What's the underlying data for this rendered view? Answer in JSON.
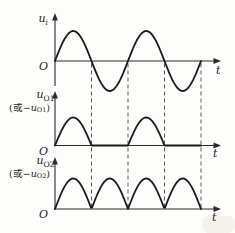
{
  "figure": {
    "plots": [
      {
        "y_label": {
          "var": "u",
          "sub": "i"
        },
        "origin": "O",
        "x_label": "t"
      },
      {
        "y_label": {
          "var": "u",
          "sub": "O1"
        },
        "alt_label": {
          "open": "(或−",
          "var": "u",
          "sub": "O1",
          "close": ")"
        },
        "origin": "O",
        "x_label": "t"
      },
      {
        "y_label": {
          "var": "u",
          "sub": "O2"
        },
        "alt_label": {
          "open": "(或−",
          "var": "u",
          "sub": "O2",
          "close": ")"
        },
        "origin": "O",
        "x_label": "t"
      }
    ],
    "dashed_zero_crossing_guides": 4,
    "colors": {
      "curve": "#1b1b1b",
      "axis": "#2a2a2a",
      "dash": "#5a5a5a",
      "background": "#fdfdfc",
      "paper_tint": "#e9e2d4"
    }
  },
  "chart_data": [
    {
      "type": "line",
      "name": "u_i",
      "ylabel": "u_i",
      "xlabel": "t",
      "waveform": "sine",
      "cycles": 2,
      "amplitude": 1,
      "ylim": [
        -1,
        1
      ],
      "grid": false,
      "description": "Input sinusoidal voltage: two full cycles starting upward from the origin O"
    },
    {
      "type": "line",
      "name": "u_O1 (或 −u_O1)",
      "ylabel": "u_O1",
      "xlabel": "t",
      "waveform": "half-wave-rectified",
      "cycles": 2,
      "amplitude": 0.93,
      "ylim": [
        0,
        1
      ],
      "grid": false,
      "description": "Half-wave rectified output: positive half-cycle humps, zero during negative half-cycles"
    },
    {
      "type": "line",
      "name": "u_O2 (或 −u_O2)",
      "ylabel": "u_O2",
      "xlabel": "t",
      "waveform": "full-wave-rectified",
      "cycles": 2,
      "amplitude": 1,
      "ylim": [
        0,
        1
      ],
      "grid": false,
      "description": "Full-wave rectified output: absolute value of the sine, four humps aligned with the dashed half-period guides"
    }
  ]
}
